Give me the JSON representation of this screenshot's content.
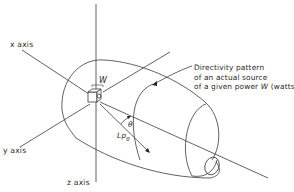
{
  "figure": {
    "axes": {
      "x_label": "x axis",
      "y_label": "y axis",
      "z_label": "z axis"
    },
    "source_label": "W",
    "angle_label": "θ",
    "level_label_main": "Lp",
    "level_label_sub": "θ",
    "caption": {
      "line1": "Directivity pattern",
      "line2": "of an actual source",
      "line3_prefix": "of a given power ",
      "line3_symbol": "W",
      "line3_suffix": " (watts)"
    },
    "colors": {
      "line": "#3a3a3a",
      "text": "#2a2a2a",
      "background": "#ffffff"
    }
  }
}
